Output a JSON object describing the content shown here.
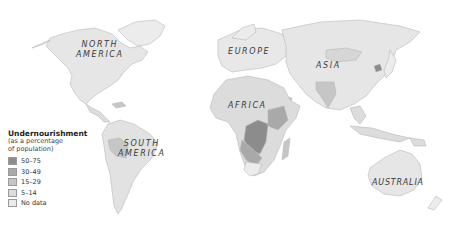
{
  "map": {
    "title": "Undernourishment",
    "subtitle_line1": "(as a percentage",
    "subtitle_line2": "of population)",
    "legend": [
      {
        "label": "50–75",
        "color": "#8c8c8c"
      },
      {
        "label": "30–49",
        "color": "#a9a9a9"
      },
      {
        "label": "15–29",
        "color": "#c6c6c6"
      },
      {
        "label": "5–14",
        "color": "#dcdcdc"
      },
      {
        "label": "No data",
        "color": "#ececec"
      }
    ],
    "regions": {
      "north_america_line1": "NORTH",
      "north_america_line2": "AMERICA",
      "south_america_line1": "SOUTH",
      "south_america_line2": "AMERICA",
      "europe": "EUROPE",
      "asia": "ASIA",
      "africa": "AFRICA",
      "australia": "AUSTRALIA"
    }
  }
}
